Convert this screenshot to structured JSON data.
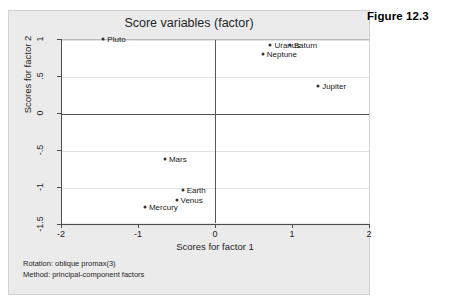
{
  "figure": {
    "caption": "Figure 12.3"
  },
  "chart_data": {
    "type": "scatter",
    "title": "Score variables (factor)",
    "xlabel": "Scores for factor 1",
    "ylabel": "Scores for factor 2",
    "xlim": [
      -2,
      2
    ],
    "ylim": [
      -1.5,
      1
    ],
    "xticks": [
      "-2",
      "-1",
      "0",
      "1",
      "2"
    ],
    "xtick_values": [
      -2,
      -1,
      0,
      1,
      2
    ],
    "yticks": [
      "1",
      ".5",
      "0",
      "-.5",
      "-1",
      "-1.5"
    ],
    "ytick_values": [
      1,
      0.5,
      0,
      -0.5,
      -1,
      -1.5
    ],
    "grid": true,
    "legend": "none",
    "reference_lines": {
      "vertical_at_x": 0,
      "horizontal_at_y": 0
    },
    "points": [
      {
        "label": "Pluto",
        "x": -1.45,
        "y": 1.0,
        "label_side": "right"
      },
      {
        "label": "Uranus",
        "x": 0.72,
        "y": 0.92,
        "label_side": "right"
      },
      {
        "label": "Saturn",
        "x": 0.97,
        "y": 0.92,
        "label_side": "right"
      },
      {
        "label": "Neptune",
        "x": 0.62,
        "y": 0.8,
        "label_side": "right"
      },
      {
        "label": "Jupiter",
        "x": 1.34,
        "y": 0.37,
        "label_side": "right"
      },
      {
        "label": "Mars",
        "x": -0.65,
        "y": -0.62,
        "label_side": "right"
      },
      {
        "label": "Earth",
        "x": -0.42,
        "y": -1.04,
        "label_side": "right"
      },
      {
        "label": "Venus",
        "x": -0.5,
        "y": -1.18,
        "label_side": "right"
      },
      {
        "label": "Mercury",
        "x": -0.91,
        "y": -1.27,
        "label_side": "right"
      }
    ]
  },
  "footnotes": {
    "rotation": "Rotation: oblique promax(3)",
    "method": "Method: principal-component factors"
  }
}
